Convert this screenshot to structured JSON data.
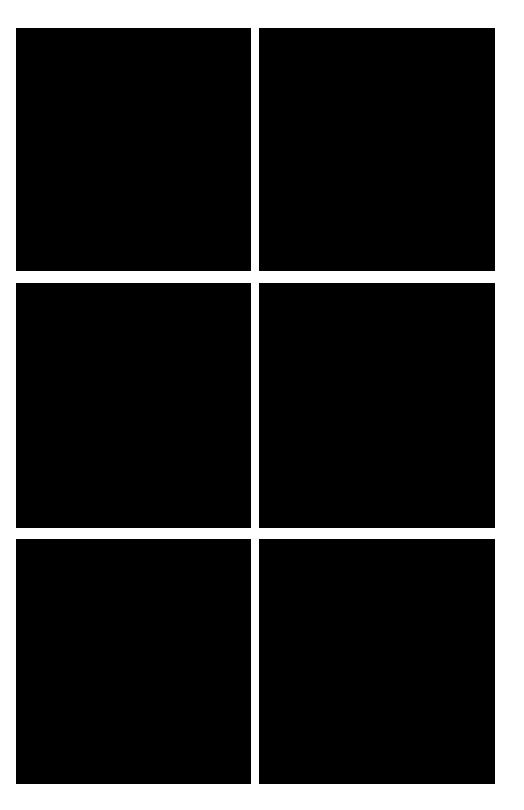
{
  "layout": {
    "rows": 3,
    "columns": 2,
    "background_color": "#ffffff",
    "panel_color": "#000000"
  },
  "panels": [
    {
      "row": 1,
      "column": 1,
      "fill": "black"
    },
    {
      "row": 1,
      "column": 2,
      "fill": "black"
    },
    {
      "row": 2,
      "column": 1,
      "fill": "black"
    },
    {
      "row": 2,
      "column": 2,
      "fill": "black"
    },
    {
      "row": 3,
      "column": 1,
      "fill": "black"
    },
    {
      "row": 3,
      "column": 2,
      "fill": "black"
    }
  ]
}
